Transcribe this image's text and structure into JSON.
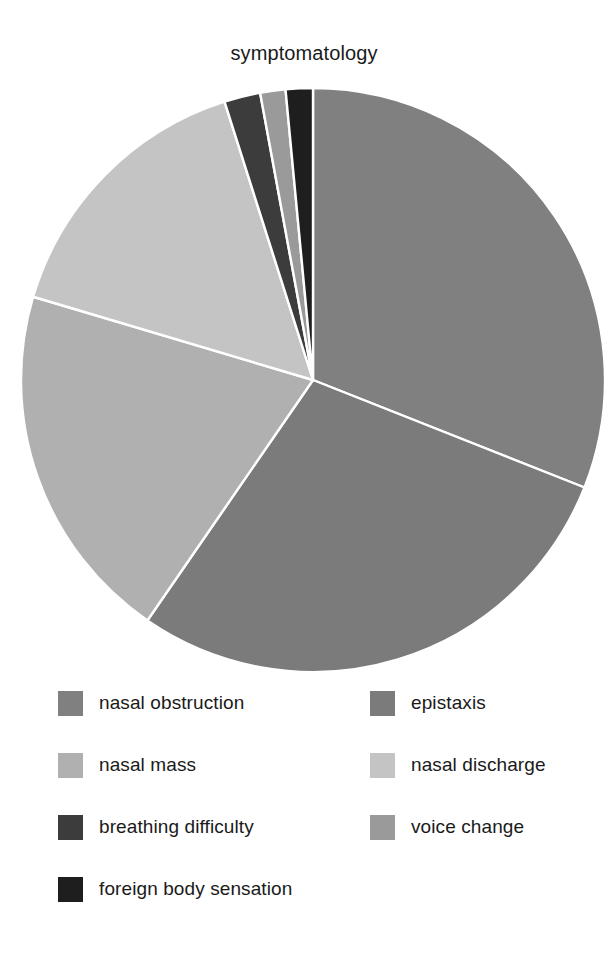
{
  "chart_data": {
    "type": "pie",
    "title": "symptomatology",
    "xlabel": "",
    "ylabel": "",
    "legend_position": "bottom",
    "grid": false,
    "start_angle_deg": 90,
    "direction": "clockwise",
    "categories": [
      "nasal obstruction",
      "epistaxis",
      "nasal mass",
      "nasal discharge",
      "breathing difficulty",
      "voice change",
      "foreign body sensation"
    ],
    "values": [
      31.0,
      28.6,
      20.0,
      15.5,
      2.0,
      1.4,
      1.5
    ],
    "units": "percent",
    "colors": [
      "#808080",
      "#7b7b7b",
      "#b0b0b0",
      "#c4c4c4",
      "#3c3c3c",
      "#9a9a9a",
      "#1e1e1e"
    ],
    "slices": [
      {
        "label": "nasal obstruction",
        "value": 31.0,
        "color": "#808080"
      },
      {
        "label": "epistaxis",
        "value": 28.6,
        "color": "#7b7b7b"
      },
      {
        "label": "nasal mass",
        "value": 20.0,
        "color": "#b0b0b0"
      },
      {
        "label": "nasal discharge",
        "value": 15.5,
        "color": "#c4c4c4"
      },
      {
        "label": "breathing difficulty",
        "value": 2.0,
        "color": "#3c3c3c"
      },
      {
        "label": "voice change",
        "value": 1.4,
        "color": "#9a9a9a"
      },
      {
        "label": "foreign body sensation",
        "value": 1.5,
        "color": "#1e1e1e"
      }
    ]
  },
  "legend": {
    "entries": [
      {
        "label": "nasal obstruction",
        "color": "#808080"
      },
      {
        "label": "epistaxis",
        "color": "#7b7b7b"
      },
      {
        "label": "nasal mass",
        "color": "#b0b0b0"
      },
      {
        "label": "nasal discharge",
        "color": "#c4c4c4"
      },
      {
        "label": "breathing difficulty",
        "color": "#3c3c3c"
      },
      {
        "label": "voice change",
        "color": "#9a9a9a"
      },
      {
        "label": "foreign body sensation",
        "color": "#1e1e1e"
      }
    ]
  },
  "style": {
    "background": "#ffffff",
    "text_color": "#1a1a1a",
    "wedge_edge_color": "#ffffff"
  }
}
